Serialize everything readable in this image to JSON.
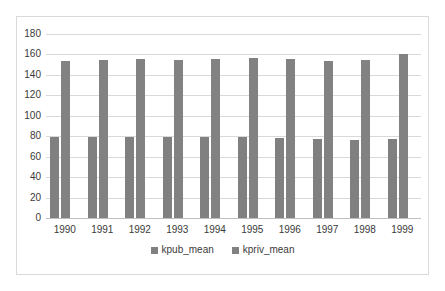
{
  "chart_data": {
    "type": "bar",
    "title": "",
    "xlabel": "",
    "ylabel": "",
    "categories": [
      "1990",
      "1991",
      "1992",
      "1993",
      "1994",
      "1995",
      "1996",
      "1997",
      "1998",
      "1999"
    ],
    "series": [
      {
        "name": "kpub_mean",
        "color": "#808080",
        "values": [
          79,
          79,
          79,
          79,
          79,
          79,
          78,
          77,
          76,
          77
        ]
      },
      {
        "name": "kpriv_mean",
        "color": "#828282",
        "values": [
          154,
          155,
          156,
          155,
          156,
          157,
          156,
          154,
          155,
          160
        ]
      }
    ],
    "ylim": [
      0,
      180
    ],
    "yticks": [
      0,
      20,
      40,
      60,
      80,
      100,
      120,
      140,
      160,
      180
    ],
    "ytick_labels": [
      "0",
      "20",
      "40",
      "60",
      "80",
      "100",
      "120",
      "140",
      "160",
      "180"
    ],
    "grid": true,
    "legend_position": "bottom",
    "plot_background": "#ffffff",
    "grid_color": "#d9d9d9",
    "axis_text_color": "#3a3a3a",
    "frame_color": "#d9d9d9"
  }
}
